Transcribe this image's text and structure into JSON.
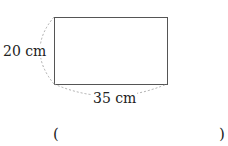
{
  "diagram": {
    "shape": "rectangle",
    "height_label": "20 cm",
    "width_label": "35 cm",
    "stroke_color": "#555555",
    "dash_color": "#999999"
  },
  "answer": {
    "open_paren": "(",
    "close_paren": ")",
    "value": ""
  }
}
